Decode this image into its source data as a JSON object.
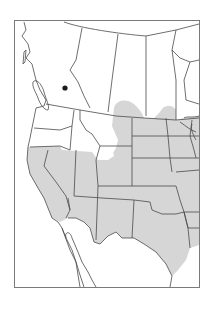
{
  "figure": {
    "type": "range-map",
    "region": "Western North America",
    "frame": {
      "x": 14,
      "y": 20,
      "width": 185,
      "height": 267
    },
    "colors": {
      "background": "#ffffff",
      "land": "#ffffff",
      "range_fill": "#d6d6d6",
      "border": "#4a4a4a",
      "frame": "#7a7a7a",
      "marker": "#1a1a1a"
    },
    "range": {
      "label": "shaded distribution",
      "description": "Grey shaded area covering southwestern and central United States, extending north into southern Canadian prairies"
    },
    "markers": [
      {
        "name": "isolated-record",
        "x": 65,
        "y": 88,
        "radius": 2.6
      }
    ]
  }
}
